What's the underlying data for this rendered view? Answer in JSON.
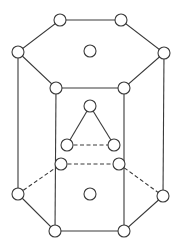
{
  "diagram": {
    "colors": {
      "stroke": "#3a3a3a",
      "background": "#ffffff",
      "atom_fill": "#ffffff"
    },
    "atom_radius": 6,
    "atoms": [
      {
        "id": "top-back-left",
        "x": 60,
        "y": 20
      },
      {
        "id": "top-back-right",
        "x": 121,
        "y": 20
      },
      {
        "id": "top-left",
        "x": 18,
        "y": 52
      },
      {
        "id": "top-right",
        "x": 164,
        "y": 53
      },
      {
        "id": "top-front-left",
        "x": 56,
        "y": 88
      },
      {
        "id": "top-front-right",
        "x": 124,
        "y": 88
      },
      {
        "id": "top-center",
        "x": 90,
        "y": 51
      },
      {
        "id": "mid-top",
        "x": 90,
        "y": 106
      },
      {
        "id": "mid-left",
        "x": 67,
        "y": 145
      },
      {
        "id": "mid-right",
        "x": 114,
        "y": 145
      },
      {
        "id": "bottom-back-left",
        "x": 61,
        "y": 164
      },
      {
        "id": "bottom-back-right",
        "x": 119,
        "y": 164
      },
      {
        "id": "bottom-left",
        "x": 18,
        "y": 194
      },
      {
        "id": "bottom-right",
        "x": 163,
        "y": 196
      },
      {
        "id": "bottom-front-left",
        "x": 55,
        "y": 231
      },
      {
        "id": "bottom-front-right",
        "x": 124,
        "y": 231
      },
      {
        "id": "bottom-center",
        "x": 90,
        "y": 194
      }
    ]
  }
}
